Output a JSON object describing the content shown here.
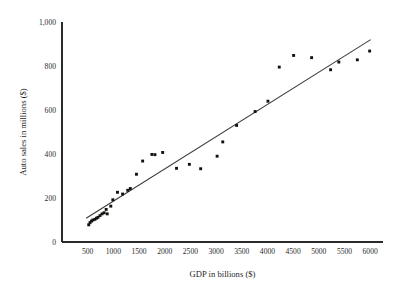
{
  "chart_data": {
    "type": "scatter",
    "title": "",
    "xlabel": "GDP in billions ($)",
    "ylabel": "Auto sales in millions ($)",
    "xlim": [
      0,
      6250
    ],
    "ylim": [
      0,
      1000
    ],
    "xticks": [
      500,
      1000,
      1500,
      2000,
      2500,
      3000,
      3500,
      4000,
      4500,
      5000,
      5500,
      6000
    ],
    "xticklabels": [
      "500",
      "1000",
      "1500",
      "2000",
      "2500",
      "3000",
      "3500",
      "4000",
      "4500",
      "5000",
      "5500",
      "6000"
    ],
    "yticks": [
      0,
      200,
      400,
      600,
      800,
      1000
    ],
    "yticklabels": [
      "0",
      "200",
      "400",
      "600",
      "800",
      "1,000"
    ],
    "grid": false,
    "legend": false,
    "marker_color": "#14120f",
    "line_color": "#3a3a3a",
    "axis_color": "#2a2a2a",
    "series": [
      {
        "name": "Auto sales vs GDP",
        "marker": "square",
        "points": [
          [
            520,
            78
          ],
          [
            545,
            88
          ],
          [
            575,
            95
          ],
          [
            600,
            100
          ],
          [
            640,
            103
          ],
          [
            670,
            108
          ],
          [
            700,
            112
          ],
          [
            740,
            120
          ],
          [
            780,
            128
          ],
          [
            820,
            133
          ],
          [
            860,
            148
          ],
          [
            880,
            128
          ],
          [
            950,
            163
          ],
          [
            990,
            192
          ],
          [
            1080,
            226
          ],
          [
            1180,
            218
          ],
          [
            1280,
            235
          ],
          [
            1330,
            243
          ],
          [
            1450,
            308
          ],
          [
            1570,
            368
          ],
          [
            1750,
            398
          ],
          [
            1810,
            397
          ],
          [
            1960,
            407
          ],
          [
            2230,
            335
          ],
          [
            2480,
            353
          ],
          [
            2700,
            333
          ],
          [
            3020,
            390
          ],
          [
            3130,
            455
          ],
          [
            3400,
            530
          ],
          [
            3760,
            593
          ],
          [
            4010,
            640
          ],
          [
            4230,
            795
          ],
          [
            4510,
            848
          ],
          [
            4860,
            838
          ],
          [
            5230,
            783
          ],
          [
            5390,
            818
          ],
          [
            5750,
            828
          ],
          [
            5990,
            868
          ]
        ]
      }
    ],
    "trendline": {
      "name": "least-squares fit",
      "x_start": 470,
      "y_start": 108,
      "x_end": 6010,
      "y_end": 920
    }
  }
}
